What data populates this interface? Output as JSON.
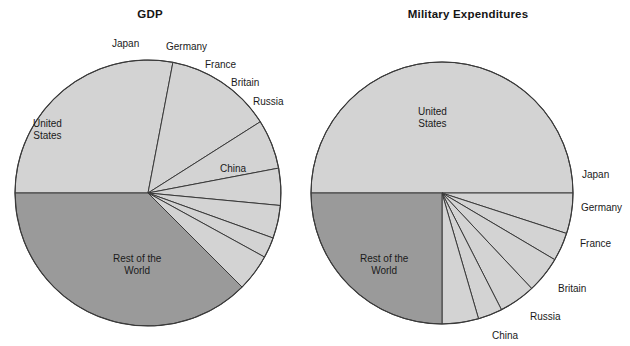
{
  "figure": {
    "background": "#ffffff",
    "colors": {
      "light_slice": "#d3d3d3",
      "dark_slice": "#9a9a9a",
      "outline": "#3a3a3a",
      "text": "#1a1a1a"
    }
  },
  "charts": [
    {
      "id": "gdp",
      "title": "GDP",
      "center_x": 148,
      "center_y": 193,
      "radius": 133,
      "labels": [
        {
          "name": "united-states",
          "text": "United\nStates",
          "x": 33,
          "y": 118
        },
        {
          "name": "japan",
          "text": "Japan",
          "x": 112,
          "y": 38
        },
        {
          "name": "germany",
          "text": "Germany",
          "x": 166,
          "y": 41
        },
        {
          "name": "france",
          "text": "France",
          "x": 205,
          "y": 59
        },
        {
          "name": "britain",
          "text": "Britain",
          "x": 231,
          "y": 77
        },
        {
          "name": "russia",
          "text": "Russia",
          "x": 253,
          "y": 96
        },
        {
          "name": "china",
          "text": "China",
          "x": 220,
          "y": 163
        },
        {
          "name": "rest-of-the-world",
          "text": "Rest of the\nWorld",
          "x": 113,
          "y": 253
        }
      ]
    },
    {
      "id": "military",
      "title": "Military Expenditures",
      "center_x": 442,
      "center_y": 193,
      "radius": 131,
      "labels": [
        {
          "name": "united-states",
          "text": "United\nStates",
          "x": 418,
          "y": 106
        },
        {
          "name": "japan",
          "text": "Japan",
          "x": 582,
          "y": 169
        },
        {
          "name": "germany",
          "text": "Germany",
          "x": 581,
          "y": 202
        },
        {
          "name": "france",
          "text": "France",
          "x": 580,
          "y": 238
        },
        {
          "name": "britain",
          "text": "Britain",
          "x": 558,
          "y": 283
        },
        {
          "name": "russia",
          "text": "Russia",
          "x": 530,
          "y": 311
        },
        {
          "name": "china",
          "text": "China",
          "x": 492,
          "y": 330
        },
        {
          "name": "rest-of-the-world",
          "text": "Rest of the\nWorld",
          "x": 360,
          "y": 253
        }
      ]
    }
  ],
  "chart_data": [
    {
      "type": "pie",
      "title": "GDP",
      "categories": [
        "United States",
        "Japan",
        "Germany",
        "France",
        "Britain",
        "Russia",
        "China",
        "Rest of the World"
      ],
      "values": [
        28.0,
        13.0,
        6.0,
        4.5,
        4.0,
        2.5,
        4.5,
        37.5
      ],
      "unit": "percent",
      "start_angle_deg": 180,
      "direction": "clockwise",
      "slice_colors": [
        "#d3d3d3",
        "#d3d3d3",
        "#d3d3d3",
        "#d3d3d3",
        "#d3d3d3",
        "#d3d3d3",
        "#d3d3d3",
        "#9a9a9a"
      ],
      "legend": "none",
      "grid": false
    },
    {
      "type": "pie",
      "title": "Military Expenditures",
      "categories": [
        "United States",
        "Japan",
        "Germany",
        "France",
        "Britain",
        "Russia",
        "China",
        "Rest of the World"
      ],
      "values": [
        50.0,
        5.0,
        3.5,
        4.5,
        4.5,
        3.0,
        4.5,
        25.0
      ],
      "unit": "percent",
      "start_angle_deg": 180,
      "direction": "clockwise",
      "slice_colors": [
        "#d3d3d3",
        "#d3d3d3",
        "#d3d3d3",
        "#d3d3d3",
        "#d3d3d3",
        "#d3d3d3",
        "#d3d3d3",
        "#9a9a9a"
      ],
      "legend": "none",
      "grid": false
    }
  ]
}
